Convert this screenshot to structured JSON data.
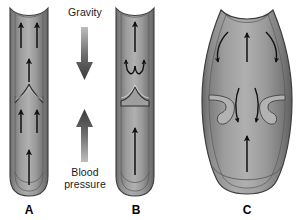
{
  "figure": {
    "background_color": "#ffffff",
    "force_labels": {
      "gravity": "Gravity",
      "blood_pressure": "Blood\npressure"
    },
    "panel_letters": {
      "a": "A",
      "b": "B",
      "c": "C"
    },
    "colors": {
      "vessel_wall_dark": "#6e6e6e",
      "vessel_wall_mid": "#8a8a8a",
      "vessel_lumen_light": "#a8a8a8",
      "vessel_lumen_mid": "#949494",
      "outline": "#3d3d3d",
      "arrow": "#111111",
      "force_arrow": "#4a4a4a",
      "text": "#1a1a1a"
    },
    "panels": [
      {
        "id": "a",
        "letter": "A",
        "description": "Normal vein with open valve, blood flowing upward",
        "valve_state": "open",
        "flow_direction": "upward",
        "flow_arrow_count": 5
      },
      {
        "id": "b",
        "letter": "B",
        "description": "Normal vein with closed valve preventing backflow",
        "valve_state": "closed",
        "flow_direction": "upward below valve, eddy above valve",
        "flow_arrow_count": 2,
        "eddy_arrow_count": 2
      },
      {
        "id": "c",
        "letter": "C",
        "description": "Dilated varicose vein with incompetent valve allowing reflux",
        "valve_state": "incompetent",
        "flow_direction": "upward center, downward reflux at sides and through valve",
        "flow_arrow_count": 2,
        "reflux_arrow_count": 4
      }
    ]
  }
}
